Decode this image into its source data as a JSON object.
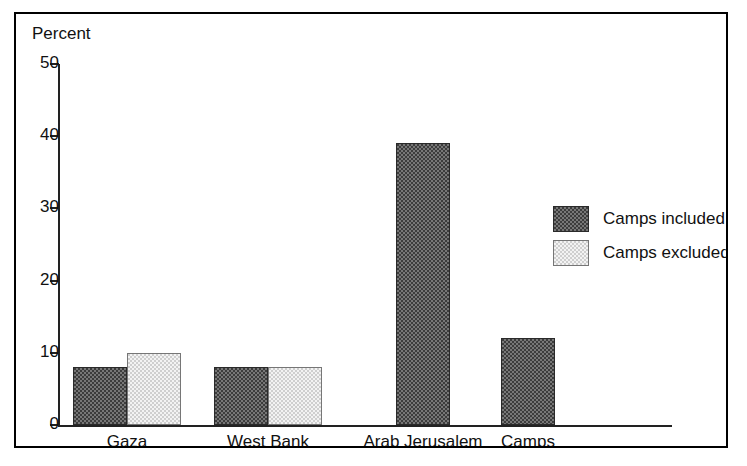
{
  "chart_data": {
    "type": "bar",
    "title": "",
    "ylabel": "Percent",
    "xlabel": "",
    "categories": [
      "Gaza",
      "West Bank",
      "Arab Jerusalem",
      "Camps"
    ],
    "series": [
      {
        "name": "Camps included",
        "color": "#3c3c3c",
        "values": [
          8,
          8,
          39,
          12
        ]
      },
      {
        "name": "Camps excluded",
        "color": "#cfcfcf",
        "values": [
          10,
          8,
          null,
          null
        ]
      }
    ],
    "ylim": [
      0,
      50
    ],
    "yticks": [
      0,
      10,
      20,
      30,
      40,
      50
    ],
    "ytick_labels": [
      "0",
      "10",
      "20",
      "30",
      "40",
      "50"
    ],
    "grid": false,
    "legend_position": "right",
    "frame": true,
    "axis_color": "#222222",
    "text_color": "#111111",
    "background": "#ffffff"
  },
  "legend": {
    "entries": [
      {
        "label": "Camps included",
        "swatch": "dark"
      },
      {
        "label": "Camps excluded",
        "swatch": "light"
      }
    ]
  }
}
